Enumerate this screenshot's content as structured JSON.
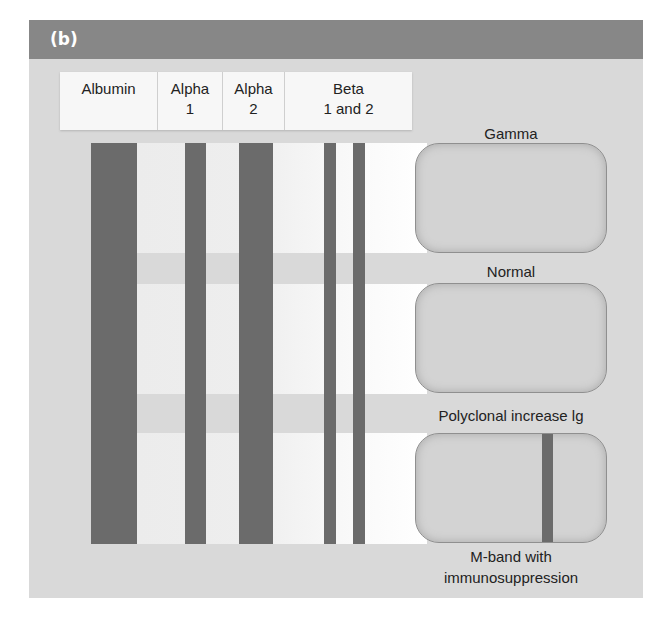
{
  "panel": {
    "tag": "(b)",
    "header_color": "#878787",
    "background_color": "#d9d9d9"
  },
  "labels": [
    {
      "text": "Albumin",
      "width": 98
    },
    {
      "text": "Alpha\n1",
      "width": 65
    },
    {
      "text": "Alpha\n2",
      "width": 62
    },
    {
      "text": "Beta\n1 and 2",
      "width": 127
    }
  ],
  "bands": [
    {
      "name": "albumin",
      "left": 62,
      "width": 46
    },
    {
      "name": "alpha-1",
      "left": 156,
      "width": 21
    },
    {
      "name": "alpha-2",
      "left": 210,
      "width": 34
    },
    {
      "name": "beta-1",
      "left": 295,
      "width": 12
    },
    {
      "name": "beta-2",
      "left": 324,
      "width": 12
    }
  ],
  "band_color": "#6b6b6b",
  "gamma_patterns": [
    {
      "label": "Gamma",
      "label_top": 124,
      "box_top": 123,
      "has_mband": false
    },
    {
      "label": "Normal",
      "label_top": 244,
      "box_top": 263,
      "has_mband": false
    },
    {
      "label": "Polyclonal increase lg",
      "label_top": 385,
      "box_top": 413,
      "has_mband": true
    }
  ],
  "captions": {
    "gamma_header": "Gamma",
    "row1": "Normal",
    "row2": "Polyclonal increase lg",
    "row3_line1": "M-band with",
    "row3_line2": "immunosuppression"
  }
}
